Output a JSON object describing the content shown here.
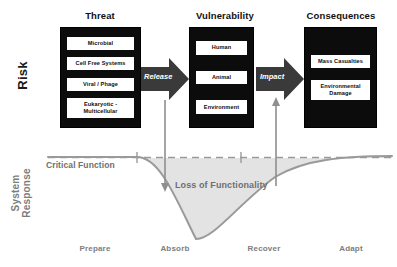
{
  "diagram": {
    "axes": {
      "risk_label": "Risk",
      "system_response_label_line1": "System",
      "system_response_label_line2": "Response"
    },
    "columns": [
      {
        "title": "Threat",
        "items": [
          "Microbial",
          "Cell Free Systems",
          "Viral / Phage",
          "Eukaryotic - Multicellular"
        ]
      },
      {
        "title": "Vulnerability",
        "items": [
          "Human",
          "Animal",
          "Environment"
        ]
      },
      {
        "title": "Consequences",
        "items": [
          "Mass Casualties",
          "Environmental Damage"
        ]
      }
    ],
    "arrows": [
      {
        "label": "Release",
        "name": "release-arrow"
      },
      {
        "label": "Impact",
        "name": "impact-arrow"
      }
    ],
    "curve": {
      "critical_function_label": "Critical Function",
      "loss_label": "Loss of Functionality"
    },
    "phases": [
      "Prepare",
      "Absorb",
      "Recover",
      "Adapt"
    ],
    "colors": {
      "box_fill": "#0c0c0c",
      "item_fill": "#ffffff",
      "curve_line": "#9a9a9a",
      "curve_fill": "#e3e3e3",
      "gray_text": "#7d7d7d",
      "dark_text": "#111111",
      "arrow_fill": "#3a3a3a"
    }
  }
}
